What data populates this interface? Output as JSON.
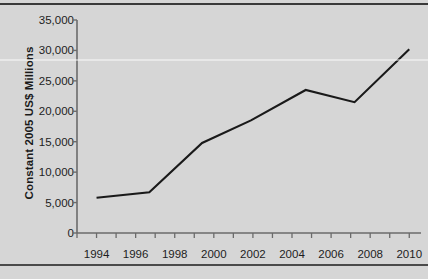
{
  "figure": {
    "background_color": "#d6d6d6",
    "frame_color": "#3a3a3a",
    "line_color": "#1a1a1a",
    "axis_color": "#6b6b6b",
    "text_color": "#1d1d1d"
  },
  "chart_data": {
    "type": "line",
    "title": "",
    "subtitle": "",
    "xlabel": "",
    "ylabel": "Constant 2005 US$ Millions",
    "xlim": [
      1993,
      2010.6
    ],
    "ylim": [
      0,
      35000
    ],
    "grid": false,
    "legend": null,
    "x_tick_labels": [
      "1994",
      "1996",
      "1998",
      "2000",
      "2002",
      "2004",
      "2006",
      "2008",
      "2010"
    ],
    "x_ticks": [
      1994,
      1996,
      1998,
      2000,
      2002,
      2004,
      2006,
      2008,
      2010
    ],
    "y_tick_labels": [
      "35,000",
      "30,000",
      "25,000",
      "20,000",
      "15,000",
      "10,000",
      "5,000",
      "0"
    ],
    "y_ticks": [
      35000,
      30000,
      25000,
      20000,
      15000,
      10000,
      5000,
      0
    ],
    "series": [
      {
        "name": "Constant 2005 US$ Millions",
        "x": [
          1994,
          1996.7,
          1999.4,
          2001.9,
          2004.7,
          2007.2,
          2010
        ],
        "values": [
          5800,
          6700,
          14800,
          18500,
          23500,
          21500,
          30200
        ]
      }
    ]
  }
}
